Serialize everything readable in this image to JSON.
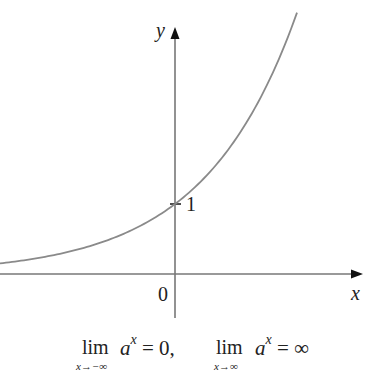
{
  "figure": {
    "axes": {
      "x_label": "x",
      "y_label": "y",
      "origin_label": "0",
      "y_tick_label": "1"
    },
    "curve": {
      "description": "exponential function y = a^x with a > 1",
      "color": "#8a8a8a"
    },
    "caption": {
      "limit1": {
        "lim": "lim",
        "sub": "x→−∞",
        "base": "a",
        "exp": "x",
        "rhs": " = 0,"
      },
      "limit2": {
        "lim": "lim",
        "sub": "x→∞",
        "base": "a",
        "exp": "x",
        "rhs": " = ∞"
      }
    }
  },
  "chart_data": {
    "type": "line",
    "title": "",
    "xlabel": "x",
    "ylabel": "y",
    "function": "y = a^x (a > 1)",
    "annotations": [
      "0",
      "1",
      "lim_{x→−∞} a^x = 0, lim_{x→∞} a^x = ∞"
    ],
    "y_intercept": 1,
    "grid": false,
    "x": [
      -2.5,
      -2,
      -1.5,
      -1,
      -0.5,
      0,
      0.5,
      1,
      1.5,
      1.75
    ],
    "values": [
      0.13,
      0.19,
      0.28,
      0.4,
      0.61,
      1.0,
      1.5,
      2.2,
      3.1,
      3.44
    ]
  }
}
